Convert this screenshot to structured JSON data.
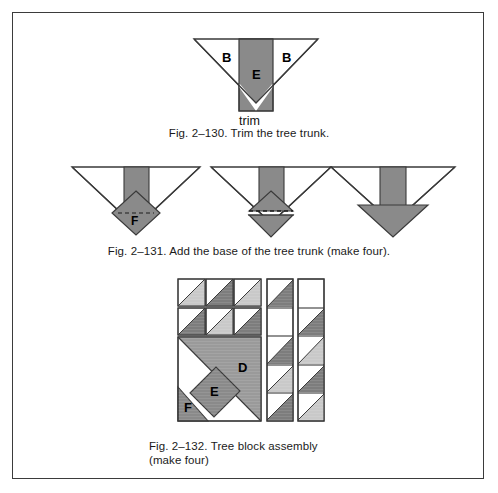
{
  "page": {
    "background": "#ffffff",
    "border_color": "#3b3b3b",
    "width": 498,
    "height": 493
  },
  "palette": {
    "outline": "#3a3a3a",
    "white": "#ffffff",
    "gray_mid": "#8a8a8a",
    "gray_dark": "#7d7d7d",
    "gray_light": "#c9c9c9",
    "gray_lighter": "#d8d8d8",
    "text": "#1a1a1a"
  },
  "figures": [
    {
      "id": "fig-2-130",
      "caption": "Fig. 2–130. Trim the tree trunk.",
      "labels": {
        "left_triangle": "B",
        "right_triangle": "B",
        "trunk": "E",
        "trim": "trim"
      }
    },
    {
      "id": "fig-2-131",
      "caption": "Fig. 2–131. Add the base of the tree trunk (make four).",
      "steps": [
        {
          "label": "F",
          "note": "diamond pinned at trunk base"
        },
        {
          "label": "",
          "note": "diamond folded down on dashed line"
        },
        {
          "label": "",
          "note": "finished trunk base unit"
        }
      ]
    },
    {
      "id": "fig-2-132",
      "caption_line1": "Fig. 2–132. Tree block assembly",
      "caption_line2": "(make four)",
      "labels": {
        "big_triangle": "D",
        "trunk_band": "E",
        "corner": "F"
      },
      "top_row_1": [
        "light",
        "dark",
        "light"
      ],
      "top_row_2": [
        "dark",
        "light",
        "dark"
      ],
      "middle_strip": [
        "dark",
        "white",
        "dark",
        "light",
        "dark"
      ],
      "right_strip": [
        "white",
        "dark",
        "light",
        "dark",
        "light"
      ]
    }
  ]
}
